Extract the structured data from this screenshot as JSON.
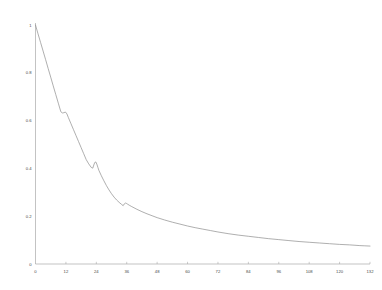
{
  "chart_data": {
    "type": "line",
    "title": "",
    "xlabel": "",
    "ylabel": "",
    "xlim": [
      0,
      132
    ],
    "ylim": [
      0,
      1
    ],
    "grid": false,
    "legend": null,
    "xticks": [
      0,
      12,
      24,
      36,
      48,
      60,
      72,
      84,
      96,
      108,
      120,
      132
    ],
    "xtick_labels": [
      "0",
      "12",
      "24",
      "36",
      "48",
      "60",
      "72",
      "84",
      "96",
      "108",
      "120",
      "132"
    ],
    "yticks": [
      0,
      0.2,
      0.4,
      0.6,
      0.8,
      1
    ],
    "ytick_labels": [
      "0",
      "0.2",
      "0.4",
      "0.6",
      "0.8",
      "1"
    ],
    "series": [
      {
        "name": "decay",
        "color": "#8c8c8c",
        "x": [
          0,
          1,
          2,
          3,
          4,
          5,
          6,
          7,
          8,
          9,
          10,
          10.6,
          11.2,
          11.8,
          12.4,
          13,
          14,
          15,
          16,
          17,
          18,
          19,
          20,
          21,
          22,
          22.6,
          23,
          23.4,
          23.8,
          24.2,
          24.6,
          25,
          26,
          27,
          28,
          29,
          30,
          31,
          32,
          33,
          34,
          34.6,
          35,
          35.4,
          35.8,
          36.4,
          37,
          38,
          40,
          42,
          44,
          46,
          48,
          51,
          54,
          57,
          60,
          63,
          66,
          69,
          72,
          76,
          80,
          84,
          88,
          92,
          96,
          100,
          104,
          108,
          112,
          116,
          120,
          124,
          128,
          130,
          132
        ],
        "y": [
          1.0,
          0.963,
          0.927,
          0.891,
          0.855,
          0.818,
          0.782,
          0.745,
          0.709,
          0.673,
          0.637,
          0.632,
          0.633,
          0.636,
          0.628,
          0.612,
          0.587,
          0.562,
          0.537,
          0.512,
          0.487,
          0.462,
          0.437,
          0.419,
          0.404,
          0.401,
          0.414,
          0.425,
          0.427,
          0.418,
          0.405,
          0.392,
          0.369,
          0.348,
          0.328,
          0.31,
          0.294,
          0.28,
          0.268,
          0.258,
          0.249,
          0.244,
          0.251,
          0.255,
          0.254,
          0.25,
          0.246,
          0.24,
          0.229,
          0.219,
          0.21,
          0.202,
          0.194,
          0.184,
          0.175,
          0.167,
          0.159,
          0.152,
          0.146,
          0.14,
          0.134,
          0.127,
          0.121,
          0.116,
          0.111,
          0.106,
          0.102,
          0.098,
          0.094,
          0.091,
          0.088,
          0.085,
          0.082,
          0.08,
          0.077,
          0.076,
          0.075
        ]
      }
    ]
  },
  "axes": {
    "x_axis_name": "x-axis",
    "y_axis_name": "y-axis"
  }
}
